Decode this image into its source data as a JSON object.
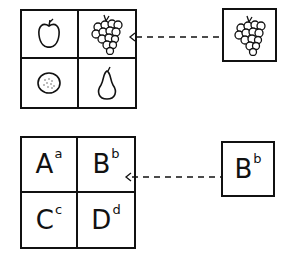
{
  "top_diagram": {
    "grid_cells": [
      {
        "icon": "apple-icon",
        "label": "apple"
      },
      {
        "icon": "grapes-icon",
        "label": "grapes"
      },
      {
        "icon": "orange-icon",
        "label": "orange"
      },
      {
        "icon": "pear-icon",
        "label": "pear"
      }
    ],
    "source": {
      "icon": "grapes-icon",
      "label": "grapes"
    },
    "arrow": {
      "style": "dashed",
      "direction": "left",
      "target_cell": 1
    }
  },
  "bottom_diagram": {
    "grid_cells": [
      {
        "letter": "A",
        "sup": "a"
      },
      {
        "letter": "B",
        "sup": "b"
      },
      {
        "letter": "C",
        "sup": "c"
      },
      {
        "letter": "D",
        "sup": "d"
      }
    ],
    "source": {
      "letter": "B",
      "sup": "b"
    },
    "arrow": {
      "style": "dashed",
      "direction": "left",
      "target_cell": 1
    }
  },
  "colors": {
    "ink": "#111111",
    "background": "#ffffff"
  }
}
